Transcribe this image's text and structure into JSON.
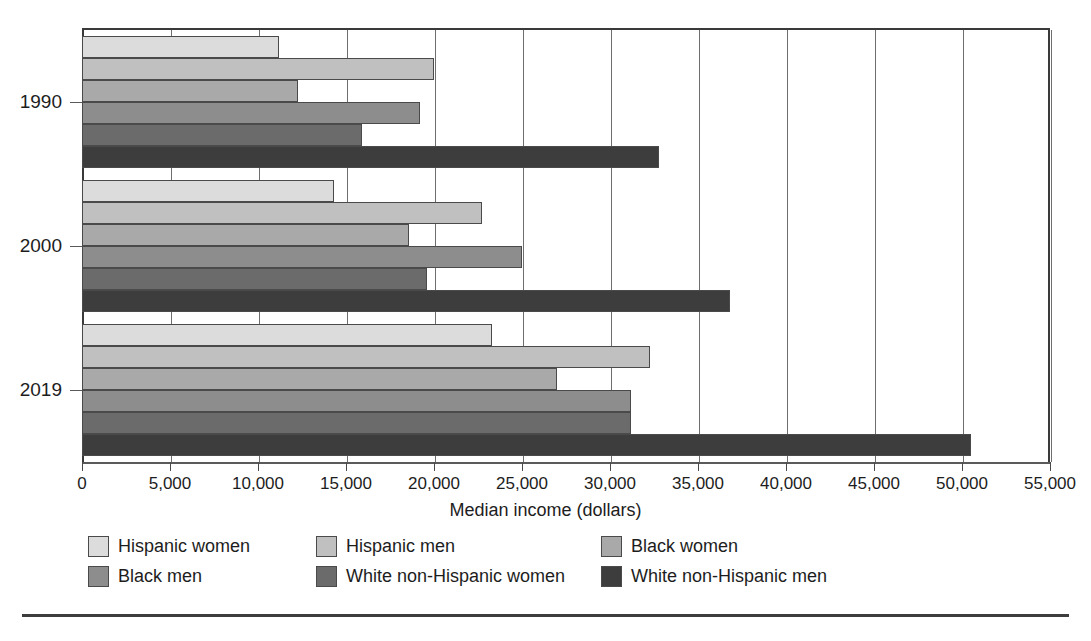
{
  "chart_data": {
    "type": "bar",
    "orientation": "horizontal",
    "title": "",
    "xlabel": "Median income (dollars)",
    "ylabel": "",
    "xlim": [
      0,
      55000
    ],
    "xticks": [
      0,
      5000,
      10000,
      15000,
      20000,
      25000,
      30000,
      35000,
      40000,
      45000,
      50000,
      55000
    ],
    "xtick_labels": [
      "0",
      "5,000",
      "10,000",
      "15,000",
      "20,000",
      "25,000",
      "30,000",
      "35,000",
      "40,000",
      "45,000",
      "50,000",
      "55,000"
    ],
    "categories": [
      "1990",
      "2000",
      "2019"
    ],
    "grid": "vertical",
    "legend_position": "bottom",
    "series": [
      {
        "name": "Hispanic women",
        "color": "#dcdcdc",
        "values": [
          11200,
          14300,
          23300
        ]
      },
      {
        "name": "Hispanic men",
        "color": "#c0c0c0",
        "values": [
          20000,
          22700,
          32300
        ]
      },
      {
        "name": "Black women",
        "color": "#a9a9a9",
        "values": [
          12300,
          18600,
          27000
        ]
      },
      {
        "name": "Black men",
        "color": "#8d8d8d",
        "values": [
          19200,
          25000,
          31200
        ]
      },
      {
        "name": "White non-Hispanic women",
        "color": "#6b6b6b",
        "values": [
          15900,
          19600,
          31200
        ]
      },
      {
        "name": "White non-Hispanic men",
        "color": "#3d3d3d",
        "values": [
          32800,
          36800,
          50500
        ]
      }
    ]
  },
  "axis": {
    "x_title": "Median income (dollars)"
  },
  "legend": {
    "rows": [
      [
        "Hispanic women",
        "Hispanic men",
        "Black women"
      ],
      [
        "Black men",
        "White non-Hispanic women",
        "White non-Hispanic men"
      ]
    ]
  }
}
